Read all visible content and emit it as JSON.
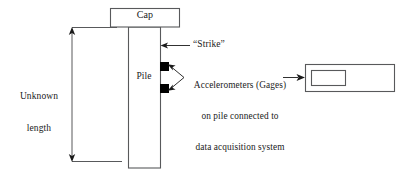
{
  "diagram": {
    "colors": {
      "line": "#58595b",
      "text": "#1a1a1a",
      "sensor_fill": "#000000",
      "background": "#ffffff"
    },
    "cap": {
      "label": "Cap"
    },
    "pile": {
      "label": "Pile"
    },
    "dimension": {
      "label_line_1": "Unknown",
      "label_line_2": "length"
    },
    "strike": {
      "label": "“Strike”"
    },
    "accelerometers": {
      "label_line_1": "Accelerometers (Gages)",
      "label_line_2": "on pile connected to",
      "label_line_3": "data acquisition system",
      "sensor_count": 2
    },
    "data_acquisition_device": {
      "screen_label": ""
    }
  }
}
